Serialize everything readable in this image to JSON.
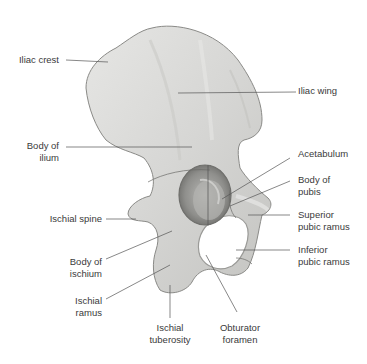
{
  "figure": {
    "colors": {
      "bone_fill": "#d8d8d6",
      "bone_shadow": "#a9a9a6",
      "bone_highlight": "#eeeeec",
      "leader_line": "#555555",
      "label_text": "#3a3a3a",
      "background": "#ffffff"
    }
  },
  "labels": {
    "iliac_crest": "Iliac crest",
    "iliac_wing": "Iliac wing",
    "body_of_ilium_1": "Body of",
    "body_of_ilium_2": "ilium",
    "acetabulum": "Acetabulum",
    "body_of_pubis_1": "Body of",
    "body_of_pubis_2": "pubis",
    "ischial_spine": "Ischial spine",
    "superior_pubic_ramus_1": "Superior",
    "superior_pubic_ramus_2": "pubic ramus",
    "body_of_ischium_1": "Body of",
    "body_of_ischium_2": "ischium",
    "inferior_pubic_ramus_1": "Inferior",
    "inferior_pubic_ramus_2": "pubic ramus",
    "ischial_ramus_1": "Ischial",
    "ischial_ramus_2": "ramus",
    "ischial_tuberosity_1": "Ischial",
    "ischial_tuberosity_2": "tuberosity",
    "obturator_foramen_1": "Obturator",
    "obturator_foramen_2": "foramen"
  }
}
